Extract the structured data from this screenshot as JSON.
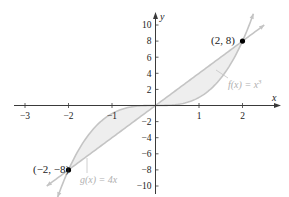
{
  "chart_data": {
    "type": "line",
    "title": "",
    "xlabel": "x",
    "ylabel": "y",
    "xlim": [
      -3.3,
      2.9
    ],
    "ylim": [
      -11,
      11
    ],
    "grid": false,
    "x_ticks": [
      -3,
      -2,
      -1,
      1,
      2
    ],
    "x_tick_labels": [
      "−3",
      "−2",
      "−1",
      "1",
      "2"
    ],
    "y_ticks": [
      10,
      8,
      6,
      4,
      2,
      -2,
      -4,
      -6,
      -8,
      -10
    ],
    "y_tick_labels": [
      "10",
      "8",
      "6",
      "4",
      "2",
      "−2",
      "−4",
      "−6",
      "−8",
      "−10"
    ],
    "series": [
      {
        "name": "f(x) = x³",
        "function": "x^3",
        "x_range": [
          -2.25,
          2.25
        ]
      },
      {
        "name": "g(x) = 4x",
        "function": "4x",
        "x_range": [
          -2.5,
          2.5
        ]
      }
    ],
    "shaded_regions": [
      {
        "between": [
          "f(x) = x³",
          "g(x) = 4x"
        ],
        "x_range": [
          -2,
          0
        ]
      },
      {
        "between": [
          "f(x) = x³",
          "g(x) = 4x"
        ],
        "x_range": [
          0,
          2
        ]
      }
    ],
    "points": [
      {
        "x": 2,
        "y": 8,
        "label": "(2, 8)"
      },
      {
        "x": -2,
        "y": -8,
        "label": "(−2, −8)"
      }
    ],
    "annotations": [
      {
        "text": "f(x) = x³",
        "target": "f"
      },
      {
        "text": "g(x) = 4x",
        "target": "g"
      }
    ]
  },
  "labels": {
    "x_axis": "x",
    "y_axis": "y",
    "point_upper": "(2, 8)",
    "point_lower": "(−2, −8)",
    "f_label_main": "f(x) = x",
    "f_label_exp": "3",
    "g_label": "g(x) = 4x"
  },
  "colors": {
    "axis": "#3a3a3a",
    "curve": "#c4c4c4",
    "fill": "#eeeeee",
    "point": "#000000",
    "label_text": "#222222",
    "curve_label_text": "#b0b0b0"
  }
}
